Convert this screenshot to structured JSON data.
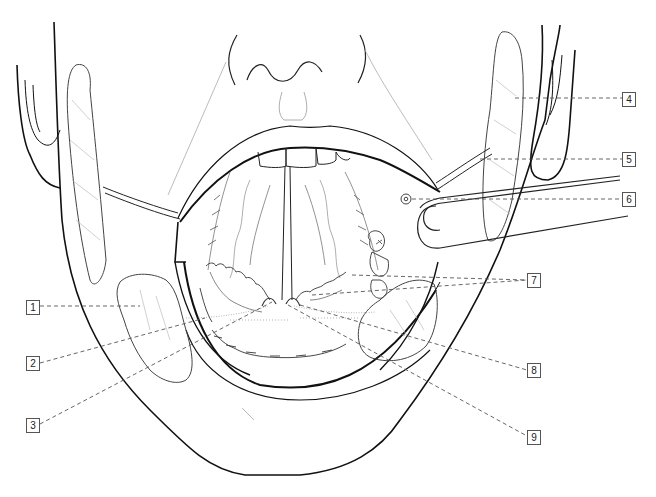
{
  "figure": {
    "subject": "Open mouth with salivary glands and ducts, frontal view",
    "line_color": "#111111",
    "gland_color": "#888888",
    "leader_color": "#555555"
  },
  "callouts": [
    {
      "number": "1",
      "x": 26,
      "y": 300,
      "side": "left"
    },
    {
      "number": "2",
      "x": 26,
      "y": 356,
      "side": "left"
    },
    {
      "number": "3",
      "x": 26,
      "y": 418,
      "side": "left"
    },
    {
      "number": "4",
      "x": 624,
      "y": 92,
      "side": "right"
    },
    {
      "number": "5",
      "x": 624,
      "y": 152,
      "side": "right"
    },
    {
      "number": "6",
      "x": 624,
      "y": 192,
      "side": "right"
    },
    {
      "number": "7",
      "x": 529,
      "y": 273,
      "side": "right"
    },
    {
      "number": "8",
      "x": 529,
      "y": 363,
      "side": "right"
    },
    {
      "number": "9",
      "x": 529,
      "y": 430,
      "side": "right"
    }
  ]
}
